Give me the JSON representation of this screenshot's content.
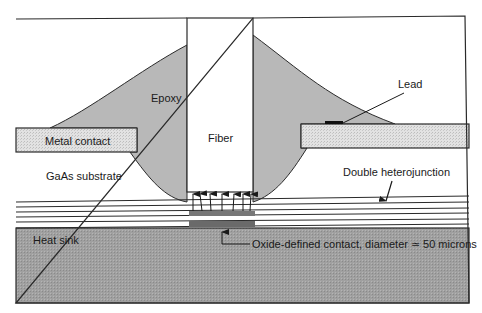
{
  "diagram": {
    "labels": {
      "epoxy": "Epoxy",
      "fiber": "Fiber",
      "lead": "Lead",
      "metal_contact": "Metal contact",
      "gaas_substrate": "GaAs substrate",
      "double_heterojunction": "Double heterojunction",
      "heat_sink": "Heat sink",
      "oxide_contact": "Oxide-defined contact, diameter ≃ 50 microns"
    },
    "colors": {
      "epoxy": "#b8b8b8",
      "heat_sink": "#9a9a9a",
      "metal_contact": "#dcdcdc",
      "outline": "#2a2a2a",
      "active_region": "#777777"
    },
    "emission_arrow_count": 7,
    "heterojunction_layer_count": 5
  }
}
